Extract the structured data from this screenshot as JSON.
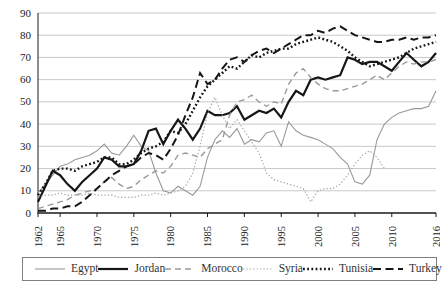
{
  "figure": {
    "kind": "line-chart-figure"
  },
  "chart_data": {
    "type": "line",
    "title": "",
    "xlabel": "",
    "ylabel": "",
    "grid": "horizontal",
    "legend_position": "bottom-boxed",
    "ylim": [
      0,
      90
    ],
    "y_tick_step": 10,
    "x_range": [
      1962,
      2016
    ],
    "x_tick_labels": [
      "1962",
      "1965",
      "1970",
      "1975",
      "1980",
      "1985",
      "1990",
      "1995",
      "2000",
      "2005",
      "2010",
      "2016"
    ],
    "colors": {
      "dark_line": "#161616",
      "gray_line": "#999999",
      "light_gray_line": "#a3a3a3",
      "gridline": "#c9c9c9",
      "axis": "#1a1a1a",
      "legend_border": "#808080"
    },
    "x": [
      1962,
      1963,
      1964,
      1965,
      1966,
      1967,
      1968,
      1969,
      1970,
      1971,
      1972,
      1973,
      1974,
      1975,
      1976,
      1977,
      1978,
      1979,
      1980,
      1981,
      1982,
      1983,
      1984,
      1985,
      1986,
      1987,
      1988,
      1989,
      1990,
      1991,
      1992,
      1993,
      1994,
      1995,
      1996,
      1997,
      1998,
      1999,
      2000,
      2001,
      2002,
      2003,
      2004,
      2005,
      2006,
      2007,
      2008,
      2009,
      2010,
      2011,
      2012,
      2013,
      2014,
      2015,
      2016
    ],
    "series": [
      {
        "name": "Egypt",
        "color": "#999999",
        "width": 1.1,
        "dash": "",
        "values": [
          9,
          13,
          17,
          21,
          22,
          24,
          25,
          26,
          28,
          31,
          27,
          26,
          30,
          35,
          30,
          28,
          18,
          10,
          9,
          12,
          10,
          8,
          12,
          25,
          33,
          37,
          34,
          38,
          31,
          33,
          32,
          36,
          37,
          30,
          41,
          37,
          35,
          34,
          33,
          31,
          29,
          25,
          22,
          14,
          13,
          17,
          33,
          40,
          43,
          45,
          46,
          47,
          47,
          48,
          55
        ]
      },
      {
        "name": "Jordan",
        "color": "#161616",
        "width": 2.2,
        "dash": "",
        "values": [
          5,
          12,
          19,
          17,
          13,
          10,
          14,
          17,
          20,
          25,
          24,
          21,
          21,
          22,
          28,
          37,
          38,
          31,
          37,
          42,
          38,
          33,
          38,
          46,
          44,
          44,
          45,
          48,
          42,
          44,
          46,
          45,
          47,
          43,
          50,
          55,
          53,
          60,
          61,
          60,
          61,
          62,
          70,
          69,
          67,
          68,
          68,
          66,
          64,
          68,
          72,
          69,
          66,
          68,
          72
        ]
      },
      {
        "name": "Morocco",
        "color": "#999999",
        "width": 1.4,
        "dash": "6 4",
        "values": [
          2,
          3,
          4,
          5,
          6,
          8,
          9,
          10,
          11,
          14,
          16,
          13,
          11,
          12,
          15,
          17,
          19,
          18,
          21,
          26,
          27,
          26,
          25,
          29,
          31,
          33,
          44,
          50,
          51,
          53,
          50,
          48,
          50,
          49,
          58,
          63,
          65,
          61,
          58,
          56,
          55,
          55,
          56,
          57,
          58,
          60,
          62,
          60,
          63,
          66,
          68,
          67,
          68,
          68,
          69
        ]
      },
      {
        "name": "Syria",
        "color": "#a3a3a3",
        "width": 1.2,
        "dash": "1.3 2.1",
        "values": [
          7,
          8,
          8,
          9,
          8,
          8,
          8,
          9,
          8,
          8,
          8,
          7,
          7,
          7,
          8,
          8,
          9,
          8,
          9,
          10,
          12,
          18,
          30,
          45,
          52,
          44,
          38,
          42,
          37,
          32,
          27,
          18,
          15,
          14,
          13,
          12,
          11,
          5,
          10,
          11,
          11,
          13,
          17,
          22,
          26,
          28,
          25,
          20,
          null,
          null,
          null,
          null,
          null,
          null,
          null
        ]
      },
      {
        "name": "Tunisia",
        "color": "#161616",
        "width": 2.4,
        "dash": "1.8 2.4",
        "values": [
          8,
          13,
          19,
          20,
          20,
          19,
          21,
          22,
          23,
          25,
          25,
          22,
          22,
          24,
          27,
          29,
          30,
          32,
          37,
          36,
          40,
          46,
          52,
          57,
          60,
          63,
          66,
          65,
          68,
          71,
          70,
          72,
          73,
          74,
          74,
          76,
          77,
          78,
          79,
          78,
          77,
          75,
          73,
          70,
          68,
          66,
          67,
          68,
          69,
          70,
          72,
          74,
          75,
          76,
          77
        ]
      },
      {
        "name": "Turkey",
        "color": "#161616",
        "width": 2.0,
        "dash": "8 4.5",
        "values": [
          1,
          1,
          2,
          2,
          3,
          3,
          5,
          8,
          11,
          14,
          17,
          19,
          21,
          22,
          25,
          27,
          26,
          24,
          29,
          35,
          44,
          52,
          63,
          58,
          60,
          65,
          69,
          70,
          68,
          71,
          73,
          74,
          72,
          74,
          76,
          78,
          80,
          80,
          82,
          81,
          83,
          84,
          82,
          80,
          79,
          78,
          77,
          77,
          78,
          78,
          79,
          78,
          79,
          79,
          80
        ]
      }
    ]
  }
}
